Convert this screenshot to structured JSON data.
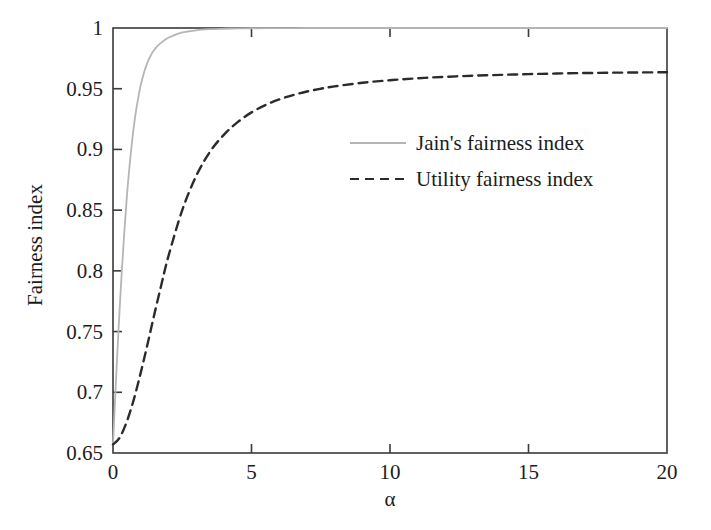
{
  "chart_data": {
    "type": "line",
    "title": "",
    "xlabel": "α",
    "ylabel": "Fairness index",
    "xlim": [
      0,
      20
    ],
    "ylim": [
      0.65,
      1.0
    ],
    "xticks": [
      0,
      5,
      10,
      15,
      20
    ],
    "xtick_labels": [
      "0",
      "5",
      "10",
      "15",
      "20"
    ],
    "yticks": [
      0.65,
      0.7,
      0.75,
      0.8,
      0.85,
      0.9,
      0.95,
      1
    ],
    "ytick_labels": [
      "0.65",
      "0.7",
      "0.75",
      "0.8",
      "0.85",
      "0.9",
      "0.95",
      "1"
    ],
    "grid": false,
    "legend_position": "center-right",
    "series": [
      {
        "name": "Jain's fairness index",
        "style": "solid",
        "color": "#b5b5b5",
        "x": [
          0,
          0.1,
          0.2,
          0.3,
          0.4,
          0.5,
          0.6,
          0.7,
          0.8,
          0.9,
          1.0,
          1.2,
          1.4,
          1.6,
          1.8,
          2.0,
          2.5,
          3.0,
          3.5,
          4.0,
          4.5,
          5.0,
          6.0,
          7.0,
          8.0,
          9.0,
          10.0,
          12.0,
          14.0,
          16.0,
          18.0,
          20.0
        ],
        "y": [
          0.657,
          0.706,
          0.752,
          0.793,
          0.829,
          0.861,
          0.887,
          0.909,
          0.927,
          0.941,
          0.953,
          0.969,
          0.979,
          0.985,
          0.989,
          0.992,
          0.9963,
          0.9981,
          0.999,
          0.9994,
          0.9997,
          0.9998,
          0.9999,
          1.0,
          1.0,
          1.0,
          1.0,
          1.0,
          1.0,
          1.0,
          1.0,
          1.0
        ]
      },
      {
        "name": "Utility fairness index",
        "style": "dashed",
        "color": "#2b2b2b",
        "x": [
          0,
          0.25,
          0.5,
          0.75,
          1.0,
          1.25,
          1.5,
          1.75,
          2.0,
          2.5,
          3.0,
          3.5,
          4.0,
          4.5,
          5.0,
          5.5,
          6.0,
          6.5,
          7.0,
          7.5,
          8.0,
          9.0,
          10.0,
          11.0,
          12.0,
          13.0,
          14.0,
          15.0,
          16.0,
          17.0,
          18.0,
          19.0,
          20.0
        ],
        "y": [
          0.657,
          0.663,
          0.676,
          0.694,
          0.716,
          0.74,
          0.765,
          0.789,
          0.812,
          0.85,
          0.878,
          0.898,
          0.912,
          0.9225,
          0.9305,
          0.9365,
          0.9412,
          0.9448,
          0.9477,
          0.95,
          0.9519,
          0.9549,
          0.957,
          0.9586,
          0.9598,
          0.9607,
          0.9614,
          0.962,
          0.9625,
          0.9629,
          0.9632,
          0.9634,
          0.9636
        ]
      }
    ]
  },
  "axes": {
    "y_axis_title": "Fairness index",
    "x_axis_title": "α"
  },
  "legend": {
    "entries": [
      {
        "label": "Jain's fairness index",
        "marker": "solid-line-swatch"
      },
      {
        "label": "Utility fairness index",
        "marker": "dashed-line-swatch"
      }
    ]
  },
  "colors": {
    "jain_line": "#b5b5b5",
    "utility_line": "#2b2b2b",
    "axis": "#3a3a3a",
    "text": "#1c1c1c",
    "background": "#ffffff"
  }
}
